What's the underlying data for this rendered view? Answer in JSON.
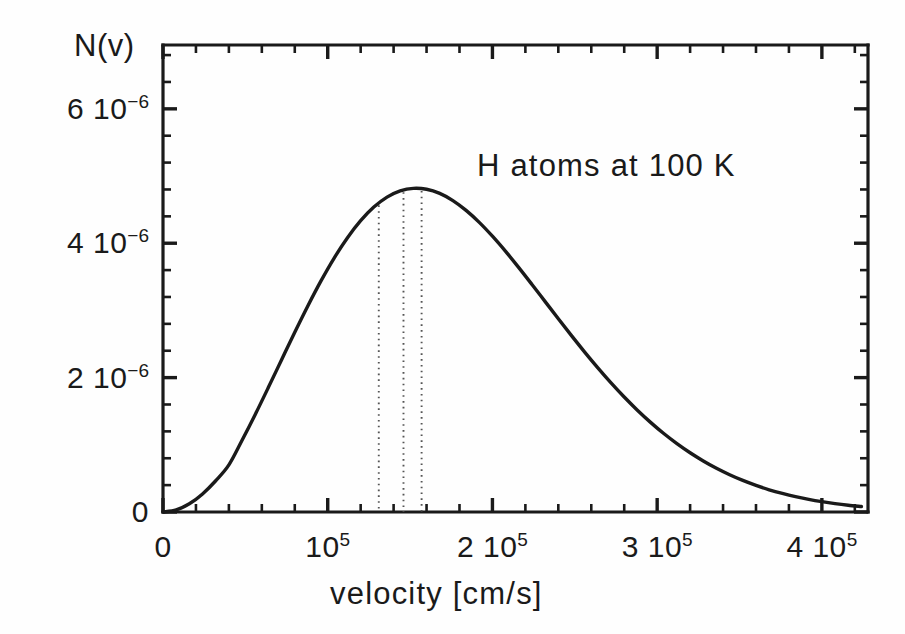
{
  "chart_data": {
    "type": "line",
    "title": "",
    "annotation": "H atoms at 100 K",
    "xlabel": "velocity [cm/s]",
    "ylabel": "N(v)",
    "xlim": [
      0,
      428000
    ],
    "ylim": [
      0,
      6.95e-06
    ],
    "grid": false,
    "legend": null,
    "x_tick_values": [
      0,
      100000,
      200000,
      300000,
      400000
    ],
    "x_tick_labels": [
      "0",
      "10|5",
      "2 10|5",
      "3 10|5",
      "4 10|5"
    ],
    "x_minor_step": 20000,
    "y_tick_values": [
      0,
      2e-06,
      4e-06,
      6e-06
    ],
    "y_tick_labels": [
      "0",
      "2 10|-6",
      "4 10|-6",
      "6 10|-6"
    ],
    "y_minor_step": 4e-07,
    "series": [
      {
        "name": "Maxwell-Boltzmann speed distribution",
        "x": [
          0,
          8000,
          16000,
          24000,
          32000,
          40000,
          48000,
          56000,
          64000,
          72000,
          80000,
          88000,
          96000,
          104000,
          112000,
          120000,
          128000,
          136000,
          144000,
          152000,
          160000,
          168000,
          176000,
          184000,
          192000,
          200000,
          208000,
          216000,
          224000,
          232000,
          240000,
          248000,
          256000,
          264000,
          272000,
          280000,
          288000,
          296000,
          304000,
          312000,
          320000,
          328000,
          336000,
          344000,
          352000,
          360000,
          368000,
          376000,
          384000,
          392000,
          400000,
          408000,
          416000,
          424000
        ],
        "y": [
          0.0,
          3.1e-08,
          1.22e-07,
          2.69e-07,
          4.65e-07,
          7.01e-07,
          1.067e-06,
          1.452e-06,
          1.855e-06,
          2.266e-06,
          2.675e-06,
          3.07e-06,
          3.443e-06,
          3.783e-06,
          4.083e-06,
          4.336e-06,
          4.538e-06,
          4.686e-06,
          4.779e-06,
          4.817e-06,
          4.803e-06,
          4.741e-06,
          4.634e-06,
          4.488e-06,
          4.31e-06,
          4.104e-06,
          3.878e-06,
          3.637e-06,
          3.386e-06,
          3.131e-06,
          2.876e-06,
          2.625e-06,
          2.38e-06,
          2.145e-06,
          1.921e-06,
          1.711e-06,
          1.515e-06,
          1.334e-06,
          1.168e-06,
          1.018e-06,
          8.82e-07,
          7.6e-07,
          6.51e-07,
          5.55e-07,
          4.7e-07,
          3.96e-07,
          3.31e-07,
          2.76e-07,
          2.28e-07,
          1.88e-07,
          1.54e-07,
          1.25e-07,
          1.01e-07,
          8.1e-08
        ],
        "peak_x": 129000,
        "peak_y": 6.29e-06
      }
    ],
    "markers": [
      {
        "name": "v-most-probable",
        "x": 131000,
        "style": "dotted-vertical"
      },
      {
        "name": "v-mean",
        "x": 146000,
        "style": "dotted-vertical"
      },
      {
        "name": "v-rms",
        "x": 157000,
        "style": "dotted-vertical"
      }
    ]
  },
  "axes": {
    "y_axis_label": "N(v)",
    "x_axis_label": "velocity [cm/s]",
    "annotation_text": "H atoms at 100 K"
  },
  "ticks": {
    "x": [
      {
        "value": "0",
        "exp": ""
      },
      {
        "value": "10",
        "exp": "5"
      },
      {
        "value": "2 10",
        "exp": "5"
      },
      {
        "value": "3 10",
        "exp": "5"
      },
      {
        "value": "4 10",
        "exp": "5"
      }
    ],
    "y": [
      {
        "value": "0",
        "exp": ""
      },
      {
        "value": "2 10",
        "exp": "−6"
      },
      {
        "value": "4 10",
        "exp": "−6"
      },
      {
        "value": "6 10",
        "exp": "−6"
      }
    ]
  },
  "style": {
    "curve_color": "#1a1a1a",
    "axis_color": "#1a1a1a",
    "marker_color": "#555555",
    "background": "#fefefe"
  }
}
